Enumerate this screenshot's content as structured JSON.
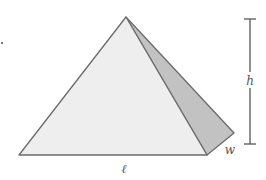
{
  "diagram": {
    "labels": {
      "height": "h",
      "width": "w",
      "length": "ℓ"
    },
    "colors": {
      "front_face": "#eeeeee",
      "side_face": "#c2c2c2",
      "edge": "#6b6b6b",
      "dimension_line": "#555555",
      "label": "#555555"
    }
  }
}
